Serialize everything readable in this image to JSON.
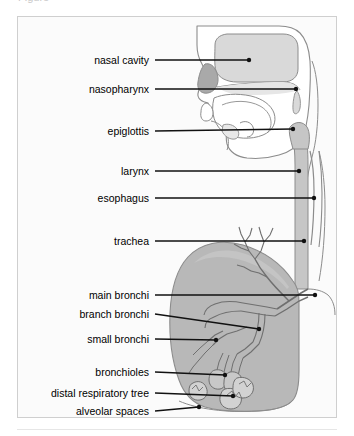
{
  "figure": {
    "title_cut_fragment": "Figure",
    "colors": {
      "page_background": "#ffffff",
      "box_background": "#fbfbfb",
      "box_border": "#cfcfcf",
      "outline_stroke": "#8c8c8c",
      "leader_line": "#111111",
      "label_text": "#000000",
      "nasal_cavity_fill": "#d9d9d9",
      "nose_turbinate_fill": "#a9a9a9",
      "airway_fill": "#c6c6c6",
      "lung_fill": "#b8b8b8",
      "lung_fill_light": "#c4c4c4",
      "separator_rule": "#e6e6e6"
    },
    "labels": [
      {
        "id": "nasal-cavity",
        "text": "nasal cavity",
        "text_x": 148,
        "text_y": 59,
        "line_x1": 154,
        "line_y1": 59,
        "line_x2": 248,
        "line_y2": 59,
        "dot": true
      },
      {
        "id": "nasopharynx",
        "text": "nasopharynx",
        "text_x": 148,
        "text_y": 88,
        "line_x1": 154,
        "line_y1": 88,
        "line_x2": 295,
        "line_y2": 88,
        "dot": true
      },
      {
        "id": "epiglottis",
        "text": "epiglottis",
        "text_x": 148,
        "text_y": 130,
        "line_x1": 154,
        "line_y1": 130,
        "line_x2": 292,
        "line_y2": 128,
        "dot": true
      },
      {
        "id": "larynx",
        "text": "larynx",
        "text_x": 148,
        "text_y": 170,
        "line_x1": 154,
        "line_y1": 170,
        "line_x2": 298,
        "line_y2": 170,
        "dot": true
      },
      {
        "id": "esophagus",
        "text": "esophagus",
        "text_x": 148,
        "text_y": 197,
        "line_x1": 154,
        "line_y1": 197,
        "line_x2": 313,
        "line_y2": 197,
        "dot": true
      },
      {
        "id": "trachea",
        "text": "trachea",
        "text_x": 148,
        "text_y": 240,
        "line_x1": 154,
        "line_y1": 240,
        "line_x2": 303,
        "line_y2": 240,
        "dot": true
      },
      {
        "id": "main-bronchi",
        "text": "main bronchi",
        "text_x": 148,
        "text_y": 294,
        "line_x1": 154,
        "line_y1": 294,
        "line_x2": 314,
        "line_y2": 294,
        "dot": true
      },
      {
        "id": "branch-bronchi",
        "text": "branch bronchi",
        "text_x": 148,
        "text_y": 313,
        "line_x1": 154,
        "line_y1": 313,
        "line_x2": 258,
        "line_y2": 328,
        "dot": true
      },
      {
        "id": "small-bronchi",
        "text": "small bronchi",
        "text_x": 148,
        "text_y": 338,
        "line_x1": 154,
        "line_y1": 338,
        "line_x2": 215,
        "line_y2": 339,
        "dot": true
      },
      {
        "id": "bronchioles",
        "text": "bronchioles",
        "text_x": 148,
        "text_y": 371,
        "line_x1": 154,
        "line_y1": 371,
        "line_x2": 224,
        "line_y2": 374,
        "dot": true
      },
      {
        "id": "distal-respiratory-tree",
        "text": "distal respiratory tree",
        "text_x": 148,
        "text_y": 392,
        "line_x1": 154,
        "line_y1": 392,
        "line_x2": 232,
        "line_y2": 395,
        "dot": true
      },
      {
        "id": "alveolar-spaces",
        "text": "alveolar spaces",
        "text_x": 148,
        "text_y": 410,
        "line_x1": 154,
        "line_y1": 410,
        "line_x2": 198,
        "line_y2": 406,
        "dot": true
      }
    ]
  }
}
